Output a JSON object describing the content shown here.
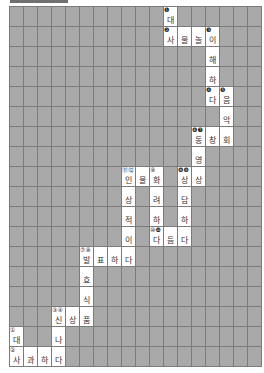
{
  "header": {
    "bar_color": "#6f6f6f"
  },
  "board": {
    "cols": 18,
    "rows": 18,
    "cell_width": 14,
    "cell_height": 20,
    "blocked_color": "#a9a9a9",
    "open_color": "#ffffff",
    "cells": [
      {
        "r": 0,
        "c": 11,
        "ch": "대",
        "num": "❶"
      },
      {
        "r": 1,
        "c": 11,
        "ch": "사",
        "num": "❷"
      },
      {
        "r": 1,
        "c": 12,
        "ch": "물"
      },
      {
        "r": 1,
        "c": 13,
        "ch": "놀"
      },
      {
        "r": 1,
        "c": 14,
        "ch": "이",
        "num": "❸"
      },
      {
        "r": 2,
        "c": 14,
        "ch": "해"
      },
      {
        "r": 3,
        "c": 14,
        "ch": "하"
      },
      {
        "r": 4,
        "c": 14,
        "ch": "다",
        "num": "❹"
      },
      {
        "r": 4,
        "c": 15,
        "ch": "음",
        "num": "❺"
      },
      {
        "r": 5,
        "c": 15,
        "ch": "악"
      },
      {
        "r": 6,
        "c": 13,
        "ch": "동",
        "num": "❻❼"
      },
      {
        "r": 6,
        "c": 14,
        "ch": "창"
      },
      {
        "r": 6,
        "c": 15,
        "ch": "회"
      },
      {
        "r": 7,
        "c": 13,
        "ch": "영"
      },
      {
        "r": 8,
        "c": 12,
        "ch": "상",
        "num": "❽❾"
      },
      {
        "r": 8,
        "c": 13,
        "ch": "상"
      },
      {
        "r": 8,
        "c": 8,
        "ch": "인",
        "num": "⑪⑫"
      },
      {
        "r": 8,
        "c": 9,
        "ch": "물"
      },
      {
        "r": 8,
        "c": 10,
        "ch": "화",
        "num": "⑨"
      },
      {
        "r": 9,
        "c": 8,
        "ch": "상"
      },
      {
        "r": 9,
        "c": 10,
        "ch": "려"
      },
      {
        "r": 9,
        "c": 12,
        "ch": "담"
      },
      {
        "r": 10,
        "c": 8,
        "ch": "적"
      },
      {
        "r": 10,
        "c": 10,
        "ch": "하"
      },
      {
        "r": 10,
        "c": 12,
        "ch": "하"
      },
      {
        "r": 11,
        "c": 8,
        "ch": "이"
      },
      {
        "r": 11,
        "c": 10,
        "ch": "다",
        "num": "⑩❿"
      },
      {
        "r": 11,
        "c": 11,
        "ch": "듬"
      },
      {
        "r": 11,
        "c": 12,
        "ch": "다"
      },
      {
        "r": 12,
        "c": 5,
        "ch": "발",
        "num": "⑦⑧"
      },
      {
        "r": 12,
        "c": 6,
        "ch": "표"
      },
      {
        "r": 12,
        "c": 7,
        "ch": "하"
      },
      {
        "r": 12,
        "c": 8,
        "ch": "다"
      },
      {
        "r": 13,
        "c": 5,
        "ch": "효"
      },
      {
        "r": 14,
        "c": 5,
        "ch": "식"
      },
      {
        "r": 15,
        "c": 3,
        "ch": "신",
        "num": "③④"
      },
      {
        "r": 15,
        "c": 4,
        "ch": "상"
      },
      {
        "r": 15,
        "c": 5,
        "ch": "품"
      },
      {
        "r": 16,
        "c": 0,
        "ch": "대",
        "num": "①"
      },
      {
        "r": 16,
        "c": 3,
        "ch": "나"
      },
      {
        "r": 17,
        "c": 0,
        "ch": "사",
        "num": "②"
      },
      {
        "r": 17,
        "c": 1,
        "ch": "과"
      },
      {
        "r": 17,
        "c": 2,
        "ch": "하"
      },
      {
        "r": 17,
        "c": 3,
        "ch": "다"
      }
    ]
  }
}
